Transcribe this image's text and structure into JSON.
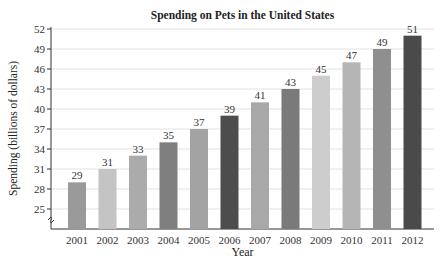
{
  "chart_data": {
    "type": "bar",
    "title": "Spending on Pets in the United States",
    "xlabel": "Year",
    "ylabel": "Spending (billions of dollars)",
    "categories": [
      "2001",
      "2002",
      "2003",
      "2004",
      "2005",
      "2006",
      "2007",
      "2008",
      "2009",
      "2010",
      "2011",
      "2012"
    ],
    "values": [
      29,
      31,
      33,
      35,
      37,
      39,
      41,
      43,
      45,
      47,
      49,
      51
    ],
    "colors": [
      "#9a9a9a",
      "#c4c4c4",
      "#ababab",
      "#7f7f7f",
      "#a3a3a3",
      "#4d4d4d",
      "#a8a8a8",
      "#7a7a7a",
      "#cdcdcd",
      "#b5b5b5",
      "#8f8f8f",
      "#4a4a4a"
    ],
    "yticks": [
      25,
      28,
      31,
      34,
      37,
      40,
      43,
      46,
      49,
      52
    ],
    "ylim": [
      22,
      52
    ],
    "axis_break": true,
    "grid": true,
    "data_labels": true
  }
}
